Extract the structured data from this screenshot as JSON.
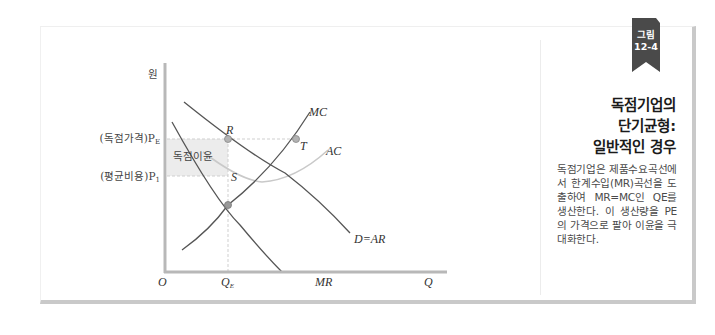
{
  "badge": {
    "line1": "그림",
    "line2": "12-4",
    "color": "#4a4a4a"
  },
  "sidebar": {
    "title_lines": [
      "독점기업의",
      "단기균형:",
      "일반적인 경우"
    ],
    "description": "독점기업은 제품수요곡선에서 한계수입(MR)곡선을 도출하여 MR=MC인 QE를 생산한다. 이 생산량을 PE의 가격으로 팔아 이윤을 극대화한다."
  },
  "diagram": {
    "y_axis_label": "원",
    "x_axis_label": "Q",
    "origin_label": "O",
    "price_labels": {
      "monopoly_price": "(독점가격)P",
      "monopoly_price_sub": "E",
      "average_cost": "(평균비용)P",
      "average_cost_sub": "1"
    },
    "quantity_label": "Q",
    "quantity_sub": "E",
    "profit_area_label": "독점이윤",
    "points": {
      "R": "R",
      "S": "S",
      "T": "T"
    },
    "curves": {
      "MC": "MC",
      "AC": "AC",
      "demand": "D=AR",
      "MR": "MR"
    },
    "colors": {
      "axis": "#b5b5b5",
      "curve": "#555555",
      "ac_curve": "#c8c8c8",
      "profit_fill": "#ececec",
      "dashed": "#cccccc",
      "point_fill": "#b0b0b0"
    }
  }
}
